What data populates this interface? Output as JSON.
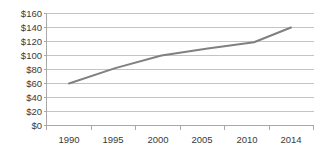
{
  "chart_data": {
    "type": "line",
    "title": "",
    "xlabel": "",
    "ylabel": "",
    "x": [
      1990,
      1995,
      2000,
      2005,
      2010,
      2014
    ],
    "values": [
      60,
      82,
      100,
      110,
      119,
      140
    ],
    "series": [
      {
        "name": "",
        "values": [
          60,
          82,
          100,
          110,
          119,
          140
        ]
      }
    ],
    "categories": [
      "1990",
      "1995",
      "2000",
      "2005",
      "2010",
      "2014"
    ],
    "x_tick_labels": [
      "1990",
      "1995",
      "2000",
      "2005",
      "2010",
      "2014"
    ],
    "y_tick_labels": [
      "$0",
      "$20",
      "$40",
      "$60",
      "$80",
      "$100",
      "$120",
      "$140",
      "$160"
    ],
    "y_tick_values": [
      0,
      20,
      40,
      60,
      80,
      100,
      120,
      140,
      160
    ],
    "ylim": [
      0,
      160
    ],
    "xlim": [
      1990,
      2014
    ],
    "grid": "horizontal",
    "legend": "none",
    "line_color": "#808080",
    "gridline_color": "#c4c4c4",
    "axis_color": "#a8a8a8",
    "background_color": "#ffffff"
  },
  "axis": {
    "y_labels": {
      "l0": "$0",
      "l1": "$20",
      "l2": "$40",
      "l3": "$60",
      "l4": "$80",
      "l5": "$100",
      "l6": "$120",
      "l7": "$140",
      "l8": "$160"
    },
    "x_labels": {
      "l0": "1990",
      "l1": "1995",
      "l2": "2000",
      "l3": "2005",
      "l4": "2010",
      "l5": "2014"
    }
  }
}
